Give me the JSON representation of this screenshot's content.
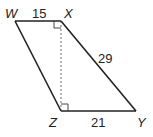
{
  "diagram": {
    "type": "trapezoid",
    "vertices": {
      "W": {
        "label": "W",
        "x": 15,
        "y": 21
      },
      "X": {
        "label": "X",
        "x": 61,
        "y": 21
      },
      "Y": {
        "label": "Y",
        "x": 136,
        "y": 111
      },
      "Z": {
        "label": "Z",
        "x": 61,
        "y": 111
      }
    },
    "edges": [
      {
        "from": "W",
        "to": "X",
        "length_label": "15"
      },
      {
        "from": "X",
        "to": "Y",
        "length_label": "29"
      },
      {
        "from": "Z",
        "to": "Y",
        "length_label": "21"
      },
      {
        "from": "W",
        "to": "Z",
        "length_label": ""
      }
    ],
    "altitude": {
      "from": "X",
      "to": "Z",
      "style": "dashed"
    },
    "right_angles": [
      "X",
      "Z"
    ],
    "labels": {
      "wx": "15",
      "xy": "29",
      "zy": "21",
      "W": "W",
      "X": "X",
      "Y": "Y",
      "Z": "Z"
    }
  }
}
